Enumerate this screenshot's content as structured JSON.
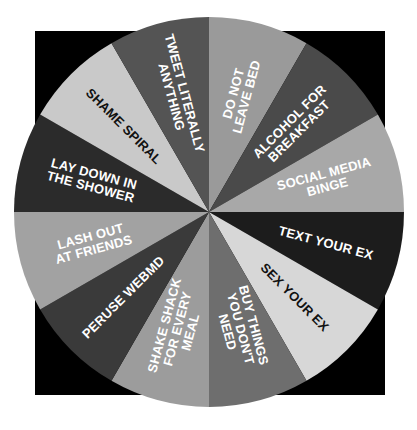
{
  "graphic": {
    "kind": "spinner-wheel",
    "background_color": "#ffffff",
    "backdrop_color": "#000000",
    "center_x": 209,
    "center_y": 212,
    "radius": 195
  },
  "chart_data": {
    "type": "pie",
    "title": "",
    "subtitle": "",
    "xlabel": "",
    "ylabel": "",
    "legend": "none",
    "grid": false,
    "start_angle_deg": -90,
    "direction": "clockwise",
    "equal_slices": true,
    "slice_angle_deg": 30,
    "categories": [
      "DO NOT LEAVE BED",
      "ALCOHOL FOR BREAKFAST",
      "SOCIAL MEDIA BINGE",
      "TEXT YOUR EX",
      "SEX YOUR EX",
      "BUY THINGS YOU DON'T NEED",
      "SHAKE SHACK FOR EVERY MEAL",
      "PERUSE WEBMD",
      "LASH OUT AT FRIENDS",
      "LAY DOWN IN THE SHOWER",
      "SHAME SPIRAL",
      "TWEET LITERALLY ANYTHING"
    ],
    "values": [
      8.3333,
      8.3333,
      8.3333,
      8.3333,
      8.3333,
      8.3333,
      8.3333,
      8.3333,
      8.3333,
      8.3333,
      8.3333,
      8.3333
    ],
    "colors": [
      "#9a9a9a",
      "#4a4a4a",
      "#a8a8a8",
      "#1c1c1c",
      "#d7d7d7",
      "#6e6e6e",
      "#9c9c9c",
      "#3a3a3a",
      "#a2a2a2",
      "#2b2b2b",
      "#c9c9c9",
      "#545454"
    ],
    "slices": [
      {
        "index": 0,
        "label": "DO NOT LEAVE BED",
        "lines": [
          "DO NOT",
          "LEAVE BED"
        ],
        "color": "#9a9a9a",
        "text_color": "#ffffff",
        "value": 8.3333
      },
      {
        "index": 1,
        "label": "ALCOHOL FOR BREAKFAST",
        "lines": [
          "ALCOHOL FOR",
          "BREAKFAST"
        ],
        "color": "#4a4a4a",
        "text_color": "#ffffff",
        "value": 8.3333
      },
      {
        "index": 2,
        "label": "SOCIAL MEDIA BINGE",
        "lines": [
          "SOCIAL MEDIA",
          "BINGE"
        ],
        "color": "#a8a8a8",
        "text_color": "#ffffff",
        "value": 8.3333
      },
      {
        "index": 3,
        "label": "TEXT YOUR EX",
        "lines": [
          "TEXT YOUR EX"
        ],
        "color": "#1c1c1c",
        "text_color": "#ffffff",
        "value": 8.3333
      },
      {
        "index": 4,
        "label": "SEX YOUR EX",
        "lines": [
          "SEX YOUR EX"
        ],
        "color": "#d7d7d7",
        "text_color": "#111111",
        "value": 8.3333
      },
      {
        "index": 5,
        "label": "BUY THINGS YOU DON'T NEED",
        "lines": [
          "BUY THINGS",
          "YOU DON'T",
          "NEED"
        ],
        "color": "#6e6e6e",
        "text_color": "#ffffff",
        "value": 8.3333
      },
      {
        "index": 6,
        "label": "SHAKE SHACK FOR EVERY MEAL",
        "lines": [
          "SHAKE SHACK",
          "FOR EVERY",
          "MEAL"
        ],
        "color": "#9c9c9c",
        "text_color": "#ffffff",
        "value": 8.3333
      },
      {
        "index": 7,
        "label": "PERUSE WEBMD",
        "lines": [
          "PERUSE WEBMD"
        ],
        "color": "#3a3a3a",
        "text_color": "#ffffff",
        "value": 8.3333
      },
      {
        "index": 8,
        "label": "LASH OUT AT FRIENDS",
        "lines": [
          "LASH OUT",
          "AT FRIENDS"
        ],
        "color": "#a2a2a2",
        "text_color": "#ffffff",
        "value": 8.3333
      },
      {
        "index": 9,
        "label": "LAY DOWN IN THE SHOWER",
        "lines": [
          "LAY DOWN IN",
          "THE SHOWER"
        ],
        "color": "#2b2b2b",
        "text_color": "#ffffff",
        "value": 8.3333
      },
      {
        "index": 10,
        "label": "SHAME SPIRAL",
        "lines": [
          "SHAME SPIRAL"
        ],
        "color": "#c9c9c9",
        "text_color": "#111111",
        "value": 8.3333
      },
      {
        "index": 11,
        "label": "TWEET LITERALLY ANYTHING",
        "lines": [
          "TWEET LITERALLY",
          "ANYTHING"
        ],
        "color": "#545454",
        "text_color": "#ffffff",
        "value": 8.3333
      }
    ]
  }
}
